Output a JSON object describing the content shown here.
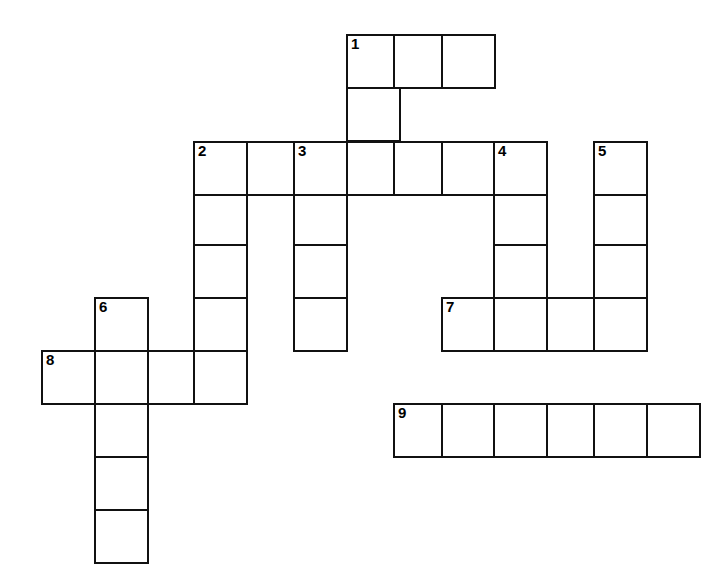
{
  "puzzle": {
    "title": "Crossword Puzzle Grid",
    "cell_size": 53,
    "border_color": "#111111",
    "cell_fill": "#ffffff",
    "background": "#ffffff",
    "origin_x": 41,
    "origin_y": 34,
    "columns": 14,
    "rows": 11,
    "column_x": [
      41,
      94,
      147,
      193,
      246,
      293,
      346,
      393,
      441,
      493,
      546,
      593,
      646,
      699
    ],
    "row_y": [
      34,
      87,
      141,
      194,
      244,
      297,
      350,
      403,
      456,
      509,
      562
    ],
    "numbered_clues": [
      {
        "number": "1",
        "col": 6,
        "row": 0,
        "direction": "across-and-down",
        "length_across": 3,
        "length_down": 4
      },
      {
        "number": "2",
        "col": 3,
        "row": 2,
        "direction": "across-and-down",
        "length_across": 7,
        "length_down": 5
      },
      {
        "number": "3",
        "col": 5,
        "row": 2,
        "direction": "down",
        "length_down": 4
      },
      {
        "number": "4",
        "col": 9,
        "row": 2,
        "direction": "down",
        "length_down": 6
      },
      {
        "number": "5",
        "col": 11,
        "row": 2,
        "direction": "down",
        "length_down": 4
      },
      {
        "number": "6",
        "col": 1,
        "row": 5,
        "direction": "down",
        "length_down": 5
      },
      {
        "number": "7",
        "col": 8,
        "row": 6,
        "direction": "across",
        "length_across": 4
      },
      {
        "number": "8",
        "col": 0,
        "row": 7,
        "direction": "across",
        "length_across": 4
      },
      {
        "number": "9",
        "col": 7,
        "row": 8,
        "direction": "across",
        "length_across": 6
      }
    ],
    "cells": [
      {
        "col": 6,
        "row": 0,
        "number": "1",
        "letter": ""
      },
      {
        "col": 7,
        "row": 0,
        "number": "",
        "letter": ""
      },
      {
        "col": 8,
        "row": 0,
        "number": "",
        "letter": ""
      },
      {
        "col": 6,
        "row": 1,
        "number": "",
        "letter": ""
      },
      {
        "col": 3,
        "row": 2,
        "number": "2",
        "letter": ""
      },
      {
        "col": 4,
        "row": 2,
        "number": "",
        "letter": ""
      },
      {
        "col": 5,
        "row": 2,
        "number": "3",
        "letter": ""
      },
      {
        "col": 6,
        "row": 2,
        "number": "",
        "letter": ""
      },
      {
        "col": 7,
        "row": 2,
        "number": "",
        "letter": ""
      },
      {
        "col": 8,
        "row": 2,
        "number": "",
        "letter": ""
      },
      {
        "col": 9,
        "row": 2,
        "number": "4",
        "letter": ""
      },
      {
        "col": 11,
        "row": 2,
        "number": "5",
        "letter": ""
      },
      {
        "col": 3,
        "row": 3,
        "number": "",
        "letter": ""
      },
      {
        "col": 5,
        "row": 3,
        "number": "",
        "letter": ""
      },
      {
        "col": 9,
        "row": 3,
        "number": "",
        "letter": ""
      },
      {
        "col": 11,
        "row": 3,
        "number": "",
        "letter": ""
      },
      {
        "col": 3,
        "row": 4,
        "number": "",
        "letter": ""
      },
      {
        "col": 5,
        "row": 4,
        "number": "",
        "letter": ""
      },
      {
        "col": 9,
        "row": 4,
        "number": "",
        "letter": ""
      },
      {
        "col": 11,
        "row": 4,
        "number": "",
        "letter": ""
      },
      {
        "col": 1,
        "row": 5,
        "number": "6",
        "letter": ""
      },
      {
        "col": 3,
        "row": 5,
        "number": "",
        "letter": ""
      },
      {
        "col": 5,
        "row": 5,
        "number": "",
        "letter": ""
      },
      {
        "col": 8,
        "row": 5,
        "number": "7",
        "letter": ""
      },
      {
        "col": 9,
        "row": 5,
        "number": "",
        "letter": ""
      },
      {
        "col": 10,
        "row": 5,
        "number": "",
        "letter": ""
      },
      {
        "col": 11,
        "row": 5,
        "number": "",
        "letter": ""
      },
      {
        "col": 0,
        "row": 6,
        "number": "8",
        "letter": ""
      },
      {
        "col": 1,
        "row": 6,
        "number": "",
        "letter": ""
      },
      {
        "col": 2,
        "row": 6,
        "number": "",
        "letter": ""
      },
      {
        "col": 3,
        "row": 6,
        "number": "",
        "letter": ""
      },
      {
        "col": 1,
        "row": 7,
        "number": "",
        "letter": ""
      },
      {
        "col": 7,
        "row": 7,
        "number": "9",
        "letter": ""
      },
      {
        "col": 8,
        "row": 7,
        "number": "",
        "letter": ""
      },
      {
        "col": 9,
        "row": 7,
        "number": "",
        "letter": ""
      },
      {
        "col": 10,
        "row": 7,
        "number": "",
        "letter": ""
      },
      {
        "col": 11,
        "row": 7,
        "number": "",
        "letter": ""
      },
      {
        "col": 12,
        "row": 7,
        "number": "",
        "letter": ""
      },
      {
        "col": 1,
        "row": 8,
        "number": "",
        "letter": ""
      },
      {
        "col": 1,
        "row": 9,
        "number": "",
        "letter": ""
      }
    ]
  }
}
